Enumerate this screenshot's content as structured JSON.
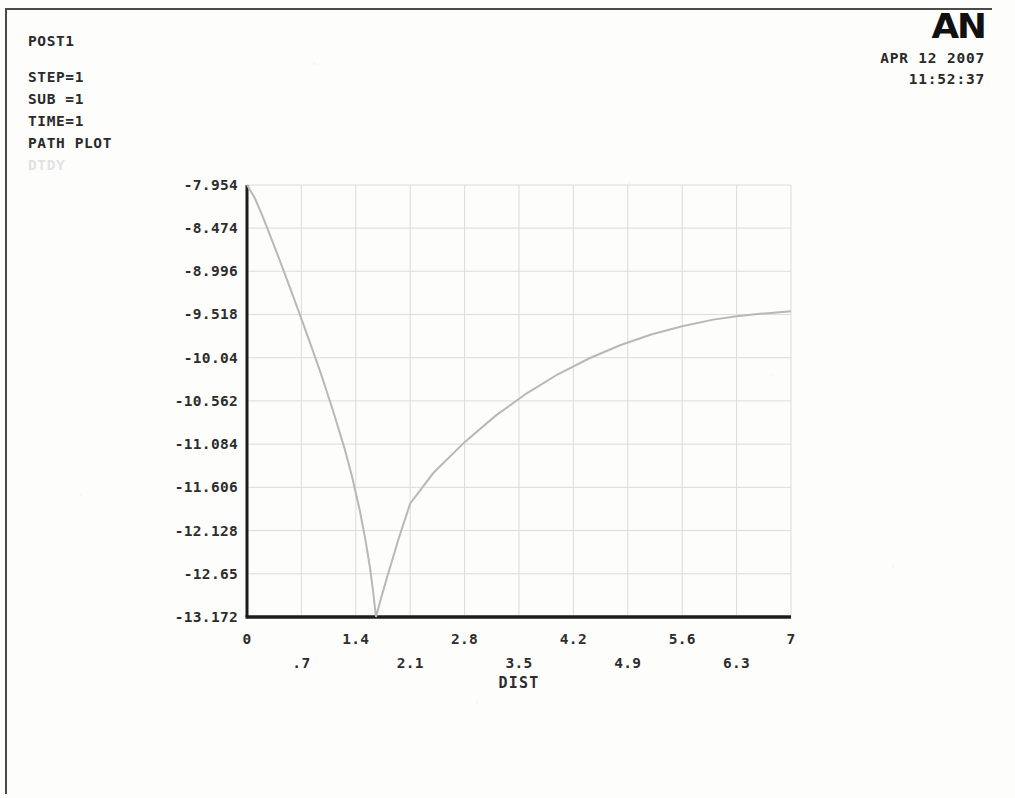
{
  "window": {
    "app": "ANSYS",
    "logo_text": "AN"
  },
  "header": {
    "title": "POST1",
    "lines": [
      "STEP=1",
      "SUB =1",
      "TIME=1",
      "PATH PLOT"
    ],
    "faint_label": "DTDY"
  },
  "stamp": {
    "date": "APR 12 2007",
    "time": "11:52:37"
  },
  "chart_data": {
    "type": "line",
    "title": "PATH PLOT",
    "xlabel": "DIST",
    "ylabel": "DTDY",
    "grid": true,
    "legend": "none",
    "xlim": [
      0,
      7
    ],
    "ylim": [
      -13.172,
      -7.954
    ],
    "xticks": [
      0,
      0.7,
      1.4,
      2.1,
      2.8,
      3.5,
      4.2,
      4.9,
      5.6,
      6.3,
      7
    ],
    "xtick_labels": [
      "0",
      ".7",
      "1.4",
      "2.1",
      "2.8",
      "3.5",
      "4.2",
      "4.9",
      "5.6",
      "6.3",
      "7"
    ],
    "yticks": [
      -7.954,
      -8.474,
      -8.996,
      -9.518,
      -10.04,
      -10.562,
      -11.084,
      -11.606,
      -12.128,
      -12.65,
      -13.172
    ],
    "ytick_labels": [
      "-7.954",
      "-8.474",
      "-8.996",
      "-9.518",
      "-10.04",
      "-10.562",
      "-11.084",
      "-11.606",
      "-12.128",
      "-12.65",
      "-13.172"
    ],
    "series": [
      {
        "name": "DTDY",
        "color": "#b8b8b8",
        "x": [
          0.0,
          0.1,
          0.2,
          0.35,
          0.5,
          0.65,
          0.8,
          0.95,
          1.1,
          1.25,
          1.35,
          1.45,
          1.52,
          1.58,
          1.62,
          1.66,
          1.72,
          1.8,
          1.95,
          2.1,
          2.4,
          2.8,
          3.2,
          3.6,
          4.0,
          4.4,
          4.8,
          5.2,
          5.6,
          6.0,
          6.3,
          6.6,
          6.85,
          7.0
        ],
        "y": [
          -7.954,
          -8.11,
          -8.33,
          -8.69,
          -9.06,
          -9.44,
          -9.83,
          -10.23,
          -10.66,
          -11.12,
          -11.47,
          -11.88,
          -12.22,
          -12.56,
          -12.84,
          -13.172,
          -12.96,
          -12.7,
          -12.23,
          -11.8,
          -11.43,
          -11.06,
          -10.74,
          -10.47,
          -10.24,
          -10.05,
          -9.89,
          -9.76,
          -9.66,
          -9.58,
          -9.54,
          -9.51,
          -9.49,
          -9.48
        ]
      }
    ]
  },
  "plot_geometry": {
    "left": 247,
    "right": 791,
    "top": 185,
    "bottom": 617
  }
}
